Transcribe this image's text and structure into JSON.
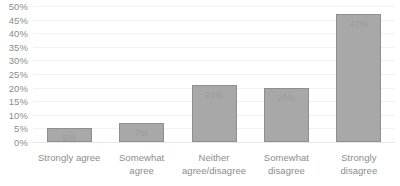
{
  "chart_data": {
    "type": "bar",
    "title": "",
    "subtitle": "",
    "xlabel": "",
    "ylabel": "",
    "ylim": [
      0,
      50
    ],
    "grid": true,
    "legend": false,
    "value_suffix": "%",
    "categories": [
      "Strongly agree",
      "Somewhat agree",
      "Neither agree/disagree",
      "Somewhat disagree",
      "Strongly disagree"
    ],
    "category_lines": [
      [
        "Strongly agree"
      ],
      [
        "Somewhat agree"
      ],
      [
        "Neither",
        "agree/disagree"
      ],
      [
        "Somewhat",
        "disagree"
      ],
      [
        "Strongly disagree"
      ]
    ],
    "values": [
      5,
      7,
      21,
      20,
      47
    ],
    "data_labels": [
      "5%",
      "7%",
      "21%",
      "20%",
      "47%"
    ],
    "y_ticks": [
      0,
      5,
      10,
      15,
      20,
      25,
      30,
      35,
      40,
      45,
      50
    ],
    "y_tick_labels": [
      "0%",
      "5%",
      "10%",
      "15%",
      "20%",
      "25%",
      "30%",
      "35%",
      "40%",
      "45%",
      "50%"
    ]
  },
  "style": {
    "bar_fill": "#a8a8a8",
    "bar_border": "#8f8f8f",
    "gridline_color": "#f2f2f2",
    "axis_line_color": "#e6e6e6",
    "tick_text_color": "#8c8c8c",
    "data_label_color": "#9a9a9a",
    "background": "#ffffff"
  }
}
